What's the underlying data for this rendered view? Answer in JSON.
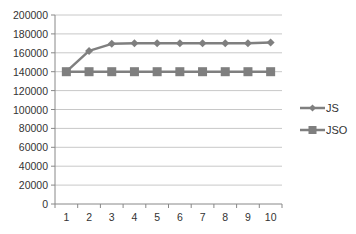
{
  "chart_data": {
    "type": "line",
    "title": "",
    "xlabel": "",
    "ylabel": "",
    "categories": [
      "1",
      "2",
      "3",
      "4",
      "5",
      "6",
      "7",
      "8",
      "9",
      "10"
    ],
    "series": [
      {
        "name": "JS",
        "marker": "diamond",
        "color": "#7f7f7f",
        "values": [
          140000,
          162000,
          169500,
          170000,
          170000,
          170000,
          170000,
          170000,
          170000,
          171000
        ]
      },
      {
        "name": "JSO",
        "marker": "square",
        "color": "#7f7f7f",
        "values": [
          140000,
          140000,
          140000,
          140000,
          140000,
          140000,
          140000,
          140000,
          140000,
          140000
        ]
      }
    ],
    "ylim": [
      0,
      200000
    ],
    "yticks": [
      0,
      20000,
      40000,
      60000,
      80000,
      100000,
      120000,
      140000,
      160000,
      180000,
      200000
    ],
    "grid": true,
    "legend_position": "right"
  },
  "legend": {
    "items": [
      {
        "label": "JS"
      },
      {
        "label": "JSO"
      }
    ]
  }
}
